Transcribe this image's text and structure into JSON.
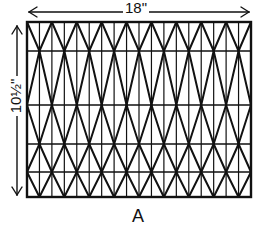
{
  "figure": {
    "label": "A",
    "dimensions": {
      "width_label": "18\"",
      "height_label": "10½\""
    },
    "pattern": "rectangle divided into vertical strips with overlapping diamond (zigzag) diagonals",
    "colors": {
      "line": "#111111",
      "background": "#ffffff"
    },
    "frame": {
      "x": 27,
      "y": 22,
      "width": 224,
      "height": 175
    },
    "horizontal_lines_y": [
      22,
      51,
      105,
      144,
      172,
      197
    ],
    "vertical_divisions": 18,
    "zigzag_columns": 9
  }
}
